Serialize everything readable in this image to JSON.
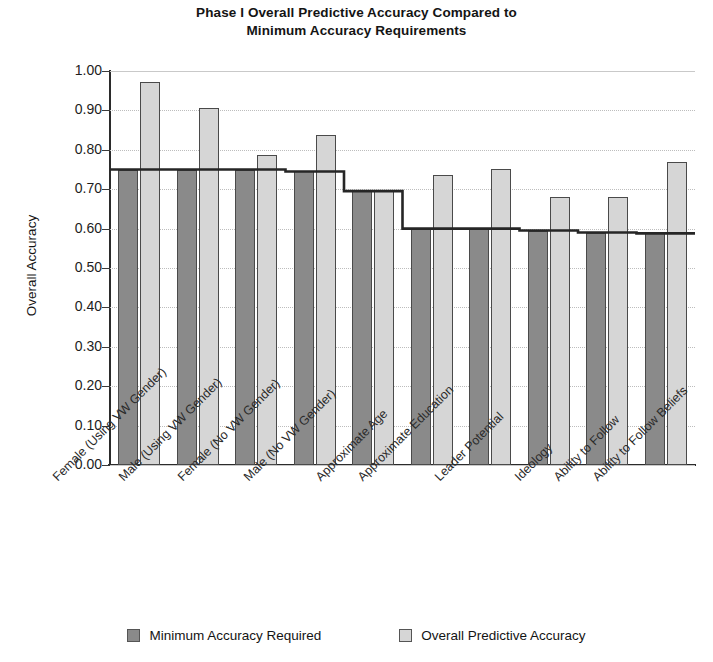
{
  "chart_data": {
    "type": "bar",
    "title": "Phase I Overall Predictive Accuracy Compared to Minimum Accuracy Requirements",
    "title_lines": [
      "Phase I Overall Predictive Accuracy Compared to",
      "Minimum Accuracy Requirements"
    ],
    "xlabel": "",
    "ylabel": "Overall Accuracy",
    "ylim": [
      0.0,
      1.0
    ],
    "ytick_labels": [
      "1.00",
      "0.90",
      "0.80",
      "0.70",
      "0.60",
      "0.50",
      "0.40",
      "0.30",
      "0.20",
      "0.10",
      "0.00"
    ],
    "ytick_values": [
      1.0,
      0.9,
      0.8,
      0.7,
      0.6,
      0.5,
      0.4,
      0.3,
      0.2,
      0.1,
      0.0
    ],
    "grid": true,
    "legend_position": "bottom",
    "categories": [
      "Female (Using VW Gender)",
      "Male (Using VW Gender)",
      "Female (No VW Gender)",
      "Male (No VW Gender)",
      "Approximate Age",
      "Approximate Education",
      "Leader Potential",
      "Ideology",
      "Ability to Follow",
      "Ability to Follow Beliefs"
    ],
    "series": [
      {
        "name": "Minimum Accuracy Required",
        "color": "#8a8a8a",
        "values": [
          0.75,
          0.75,
          0.75,
          0.745,
          0.695,
          0.6,
          0.6,
          0.595,
          0.59,
          0.588
        ]
      },
      {
        "name": "Overall Predictive Accuracy",
        "color": "#d6d6d6",
        "values": [
          0.973,
          0.905,
          0.787,
          0.838,
          0.699,
          0.735,
          0.752,
          0.681,
          0.681,
          0.768
        ]
      }
    ],
    "threshold_step_line": {
      "name": "Minimum Accuracy Required (step outline)",
      "values": [
        0.75,
        0.75,
        0.75,
        0.745,
        0.695,
        0.6,
        0.6,
        0.595,
        0.59,
        0.588
      ],
      "color": "#262626"
    }
  },
  "legend": {
    "items": [
      {
        "label": "Minimum Accuracy Required",
        "swatch": "min"
      },
      {
        "label": "Overall Predictive Accuracy",
        "swatch": "pred"
      }
    ]
  }
}
